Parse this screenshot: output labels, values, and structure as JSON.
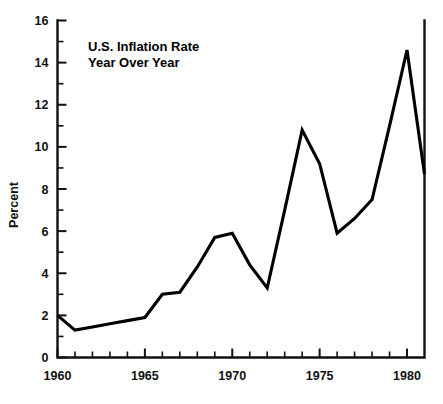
{
  "chart_data": {
    "type": "line",
    "title": "U.S. Inflation Rate",
    "subtitle": "Year Over Year",
    "xlabel": "",
    "ylabel": "Percent",
    "xlim": [
      1960,
      1981
    ],
    "ylim": [
      0,
      16
    ],
    "grid": false,
    "legend": false,
    "x_tick_labels": [
      "1960",
      "1965",
      "1970",
      "1975",
      "1980"
    ],
    "x_tick_values": [
      1960,
      1965,
      1970,
      1975,
      1980
    ],
    "x_minor_step": 1,
    "y_tick_labels": [
      "0",
      "2",
      "4",
      "6",
      "8",
      "10",
      "12",
      "14",
      "16"
    ],
    "y_tick_values": [
      0,
      2,
      4,
      6,
      8,
      10,
      12,
      14,
      16
    ],
    "y_minor_values": [
      1,
      3,
      5,
      7,
      9,
      11,
      13,
      15
    ],
    "x": [
      1960,
      1961,
      1962,
      1963,
      1964,
      1965,
      1966,
      1967,
      1968,
      1969,
      1970,
      1971,
      1972,
      1973,
      1974,
      1975,
      1976,
      1977,
      1978,
      1979,
      1980,
      1981
    ],
    "series": [
      {
        "name": "U.S. Inflation Rate",
        "color": "#000000",
        "values": [
          2.0,
          1.3,
          1.45,
          1.6,
          1.75,
          1.9,
          3.0,
          3.1,
          4.3,
          5.7,
          5.9,
          4.4,
          3.3,
          7.0,
          10.8,
          9.2,
          5.9,
          6.6,
          7.5,
          11.0,
          14.6,
          8.7
        ]
      }
    ]
  },
  "annotations": {
    "title_line1": "U.S. Inflation Rate",
    "title_line2": "Year Over Year"
  }
}
